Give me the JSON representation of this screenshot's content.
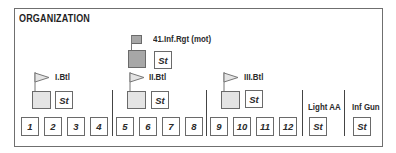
{
  "diagram": {
    "title": "ORGANIZATION",
    "regiment": {
      "label": "41.Inf.Rgt (mot)",
      "staff": "St",
      "color": "#a7a7a7"
    },
    "battalions": [
      {
        "label": "I.Btl",
        "staff": "St",
        "companies": [
          "1",
          "2",
          "3",
          "4"
        ]
      },
      {
        "label": "II.Btl",
        "staff": "St",
        "companies": [
          "5",
          "6",
          "7",
          "8"
        ]
      },
      {
        "label": "III.Btl",
        "staff": "St",
        "companies": [
          "9",
          "10",
          "11",
          "12"
        ]
      }
    ],
    "support_units": [
      {
        "label": "Light AA",
        "staff": "St"
      },
      {
        "label": "Inf Gun",
        "staff": "St"
      }
    ],
    "colors": {
      "border": "#6f6f6f",
      "hq_fill": "#e4e4e4",
      "regiment_fill": "#a7a7a7"
    }
  }
}
